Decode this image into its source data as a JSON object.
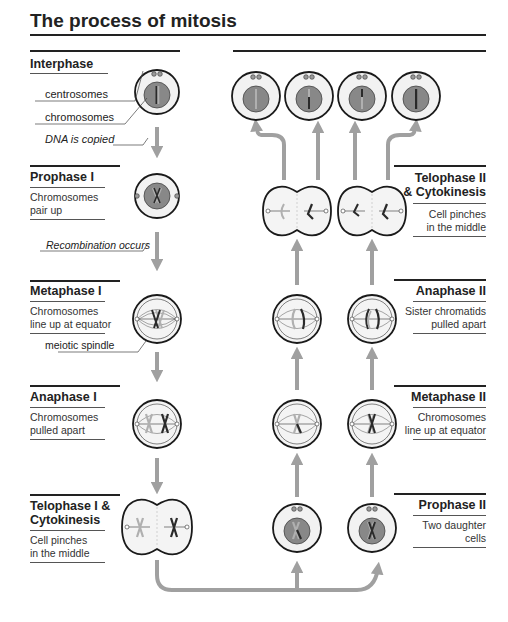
{
  "title": "The process of mitosis",
  "colors": {
    "arrow": "#a0a0a0",
    "cell_outline": "#1a1a1a",
    "cytoplasm": "#f2f2f2",
    "nucleus": "#888888",
    "chromosome_dark": "#2a2a2a",
    "chromosome_light": "#b0b0b0"
  },
  "left_column": {
    "interphase": {
      "heading": "Interphase",
      "callouts": [
        "centrosomes",
        "chromosomes"
      ],
      "note": "DNA is copied"
    },
    "prophase1": {
      "heading": "Prophase I",
      "desc_line1": "Chromosomes",
      "desc_line2": "pair up",
      "note": "Recombination occurs"
    },
    "metaphase1": {
      "heading": "Metaphase I",
      "desc_line1": "Chromosomes",
      "desc_line2": "line up at equator",
      "callout": "meiotic spindle"
    },
    "anaphase1": {
      "heading": "Anaphase I",
      "desc_line1": "Chromosomes",
      "desc_line2": "pulled apart"
    },
    "telophase1": {
      "heading_line1": "Telophase I &",
      "heading_line2": "Cytokinesis",
      "desc_line1": "Cell pinches",
      "desc_line2": "in the middle"
    }
  },
  "right_column": {
    "telophase2": {
      "heading_line1": "Telophase II",
      "heading_line2": "& Cytokinesis",
      "desc_line1": "Cell pinches",
      "desc_line2": "in the middle"
    },
    "anaphase2": {
      "heading": "Anaphase II",
      "desc_line1": "Sister chromatids",
      "desc_line2": "pulled apart"
    },
    "metaphase2": {
      "heading": "Metaphase II",
      "desc_line1": "Chromosomes",
      "desc_line2": "line up at equator"
    },
    "prophase2": {
      "heading": "Prophase II",
      "desc_line1": "Two daughter",
      "desc_line2": "cells"
    }
  },
  "final_cells_count": 4
}
